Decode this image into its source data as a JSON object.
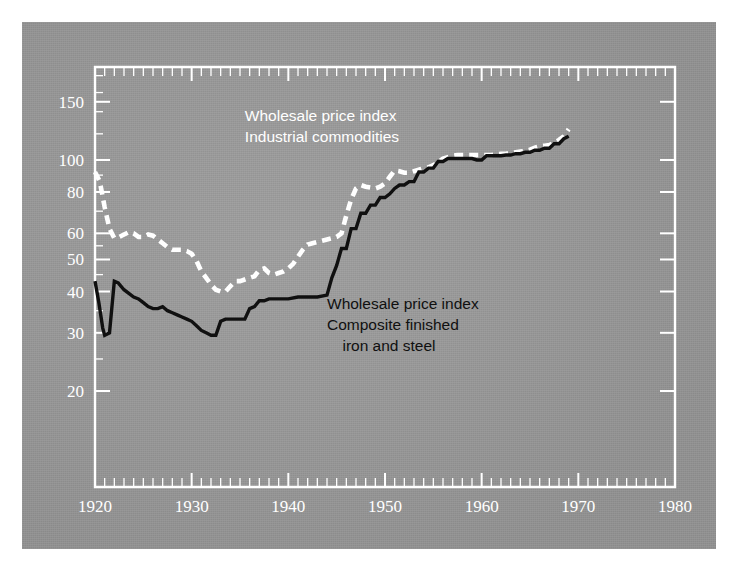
{
  "figure": {
    "background_color": "#9a9a9a",
    "frame_color": "#ffffff",
    "page_background": "#ffffff"
  },
  "chart_data": {
    "type": "line",
    "title": "",
    "subtitle": "",
    "xlabel": "",
    "ylabel": "",
    "yscale": "log",
    "xlim": [
      1920,
      1980
    ],
    "ylim": [
      15,
      200
    ],
    "grid": false,
    "legend_position": "inside-plot",
    "x_tick_labels": [
      "1920",
      "1930",
      "1940",
      "1950",
      "1960",
      "1970",
      "1980"
    ],
    "x_ticks": [
      1920,
      1930,
      1940,
      1950,
      1960,
      1970,
      1980
    ],
    "x_minor_tick_interval": 1,
    "y_tick_labels": [
      "200",
      "150",
      "100",
      "80",
      "60",
      "50",
      "40",
      "30",
      "20"
    ],
    "y_ticks": [
      200,
      150,
      100,
      80,
      60,
      50,
      40,
      30,
      20
    ],
    "annotations": [
      {
        "name": "legend-industrial-commodities",
        "color": "#ffffff",
        "lines": [
          "Wholesale price index",
          "Industrial commodities"
        ],
        "x": 1935.5,
        "y": 131
      },
      {
        "name": "legend-iron-and-steel",
        "color": "#101010",
        "lines": [
          "Wholesale price index",
          "Composite finished",
          "iron and steel"
        ],
        "x": 1944.0,
        "y": 35.5
      }
    ],
    "series": [
      {
        "name": "Wholesale price index, Industrial commodities",
        "style": "dashed",
        "color": "#ffffff",
        "x": [
          1920,
          1920.5,
          1921,
          1921.5,
          1922,
          1922.5,
          1923,
          1923.5,
          1924,
          1924.5,
          1925,
          1925.5,
          1926,
          1926.5,
          1927,
          1927.5,
          1928,
          1928.5,
          1929,
          1929.5,
          1930,
          1930.5,
          1931,
          1931.5,
          1932,
          1932.5,
          1933,
          1933.5,
          1934,
          1934.5,
          1935,
          1935.5,
          1936,
          1936.5,
          1937,
          1937.5,
          1938,
          1938.5,
          1939,
          1939.5,
          1940,
          1940.5,
          1941,
          1941.5,
          1942,
          1942.5,
          1943,
          1943.5,
          1944,
          1944.5,
          1945,
          1945.5,
          1946,
          1946.5,
          1947,
          1947.5,
          1948,
          1948.5,
          1949,
          1949.5,
          1950,
          1950.5,
          1951,
          1951.5,
          1952,
          1952.5,
          1953,
          1953.5,
          1954,
          1954.5,
          1955,
          1955.5,
          1956,
          1956.5,
          1957,
          1957.5,
          1958,
          1958.5,
          1959,
          1959.5,
          1960,
          1960.5,
          1961,
          1961.5,
          1962,
          1962.5,
          1963,
          1963.5,
          1964,
          1964.5,
          1965,
          1965.5,
          1966,
          1966.5,
          1967,
          1967.5,
          1968,
          1968.5,
          1969
        ],
        "values": [
          92,
          86,
          72,
          62,
          58,
          58.5,
          59.5,
          60.5,
          60,
          58.5,
          58.5,
          59.5,
          59,
          57.5,
          56,
          54.5,
          53.5,
          53.5,
          53.5,
          53,
          52,
          49.5,
          46,
          44,
          42,
          40.5,
          40,
          40,
          41.5,
          43,
          43,
          43.5,
          44,
          44.5,
          46.5,
          47,
          45.5,
          45,
          45.5,
          46,
          47,
          48.5,
          51,
          53.5,
          55.5,
          56,
          56.5,
          57,
          57.5,
          58,
          58.5,
          60,
          68,
          76,
          82,
          84,
          83,
          82.5,
          82,
          83,
          85,
          89,
          93,
          92.5,
          91.5,
          91.5,
          92.5,
          93.5,
          94.5,
          95,
          96.5,
          98.5,
          101,
          102,
          103,
          103.5,
          103.5,
          103.5,
          103.5,
          103.5,
          103.5,
          103.5,
          103.5,
          104,
          104.5,
          104.5,
          105,
          105.5,
          106,
          106.5,
          107.5,
          109,
          110,
          110.5,
          111,
          112.5,
          115,
          118,
          124
        ]
      },
      {
        "name": "Wholesale price index, Composite finished iron and steel",
        "style": "solid",
        "color": "#101010",
        "x": [
          1920,
          1920.4,
          1920.8,
          1921,
          1921.5,
          1922,
          1922.4,
          1923,
          1923.5,
          1924,
          1924.5,
          1925,
          1925.5,
          1926,
          1926.5,
          1927,
          1927.5,
          1928,
          1928.5,
          1929,
          1929.5,
          1930,
          1930.5,
          1931,
          1931.5,
          1932,
          1932.5,
          1933,
          1933.5,
          1934,
          1934.5,
          1935,
          1935.5,
          1936,
          1936.5,
          1937,
          1937.5,
          1938,
          1938.5,
          1939,
          1939.5,
          1940,
          1941,
          1942,
          1943,
          1944,
          1944.5,
          1945,
          1945.5,
          1946,
          1946.5,
          1947,
          1947.5,
          1948,
          1948.5,
          1949,
          1949.5,
          1950,
          1950.5,
          1951,
          1951.5,
          1952,
          1952.5,
          1953,
          1953.5,
          1954,
          1954.5,
          1955,
          1955.5,
          1956,
          1956.5,
          1957,
          1957.5,
          1958,
          1958.5,
          1959,
          1959.5,
          1960,
          1960.5,
          1961,
          1961.5,
          1962,
          1962.5,
          1963,
          1963.5,
          1964,
          1964.5,
          1965,
          1965.5,
          1966,
          1966.5,
          1967,
          1967.5,
          1968,
          1968.5,
          1969
        ],
        "values": [
          43,
          37,
          31,
          29.5,
          30,
          43,
          42.5,
          40.5,
          39.5,
          38.5,
          38,
          37,
          36,
          35.5,
          35.5,
          36,
          35,
          34.5,
          34,
          33.5,
          33,
          32.5,
          31.5,
          30.5,
          30,
          29.5,
          29.5,
          32.5,
          33,
          33,
          33,
          33,
          33,
          35.5,
          36,
          37.5,
          37.5,
          38,
          38,
          38,
          38,
          38,
          38.5,
          38.5,
          38.5,
          39,
          44,
          48,
          54,
          54,
          62,
          62,
          69,
          69,
          73,
          73,
          77,
          77,
          79,
          82,
          84,
          84,
          86,
          86,
          92,
          92,
          94.5,
          94.5,
          99,
          99,
          101,
          101,
          101,
          101,
          101,
          101,
          100,
          100,
          103,
          103,
          103,
          103,
          103.5,
          103.5,
          104.5,
          104.5,
          105.5,
          105.5,
          107,
          107,
          108.5,
          108.5,
          112,
          112,
          116,
          118
        ]
      }
    ]
  }
}
